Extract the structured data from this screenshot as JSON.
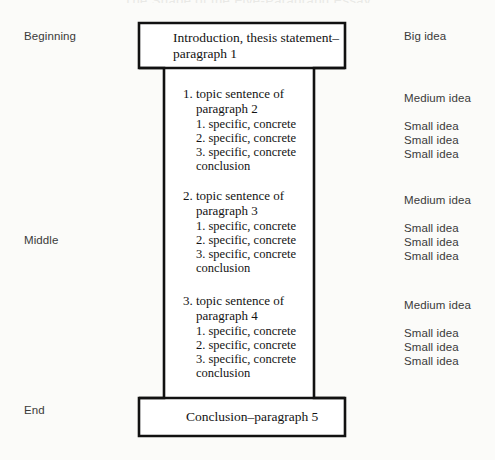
{
  "figure": {
    "title_remnant": "The Shape of the Five-Paragraph Essay",
    "background_color": "#fbfbf9",
    "stroke_color": "#111111"
  },
  "left_labels": [
    {
      "text": "Beginning",
      "top": 30
    },
    {
      "text": "Middle",
      "top": 234
    },
    {
      "text": "End",
      "top": 404
    }
  ],
  "right_labels": [
    {
      "text": "Big idea",
      "top": 30,
      "size": "big"
    },
    {
      "text": "Medium idea",
      "top": 92,
      "size": "medium"
    },
    {
      "text": "Small idea",
      "top": 120,
      "size": "small"
    },
    {
      "text": "Small idea",
      "top": 134,
      "size": "small"
    },
    {
      "text": "Small idea",
      "top": 148,
      "size": "small"
    },
    {
      "text": "Medium idea",
      "top": 194,
      "size": "medium"
    },
    {
      "text": "Small idea",
      "top": 222,
      "size": "small"
    },
    {
      "text": "Small idea",
      "top": 236,
      "size": "small"
    },
    {
      "text": "Small idea",
      "top": 250,
      "size": "small"
    },
    {
      "text": "Medium idea",
      "top": 299,
      "size": "medium"
    },
    {
      "text": "Small idea",
      "top": 327,
      "size": "small"
    },
    {
      "text": "Small idea",
      "top": 341,
      "size": "small"
    },
    {
      "text": "Small idea",
      "top": 355,
      "size": "small"
    }
  ],
  "intro_box": {
    "line1": "Introduction, thesis statement–",
    "line2": "paragraph 1"
  },
  "conclusion_box": {
    "line1": "Conclusion–paragraph 5"
  },
  "body_groups": [
    {
      "topic_line1": "1. topic sentence of",
      "topic_line2": "paragraph 2",
      "details": [
        "1. specific, concrete",
        "2. specific, concrete",
        "3. specific, concrete"
      ],
      "closing": "conclusion",
      "top": 86
    },
    {
      "topic_line1": "2. topic sentence of",
      "topic_line2": "paragraph 3",
      "details": [
        "1. specific, concrete",
        "2. specific, concrete",
        "3. specific, concrete"
      ],
      "closing": "conclusion",
      "top": 188
    },
    {
      "topic_line1": "3. topic sentence of",
      "topic_line2": "paragraph 4",
      "details": [
        "1. specific, concrete",
        "2. specific, concrete",
        "3. specific, concrete"
      ],
      "closing": "conclusion",
      "top": 293
    }
  ]
}
